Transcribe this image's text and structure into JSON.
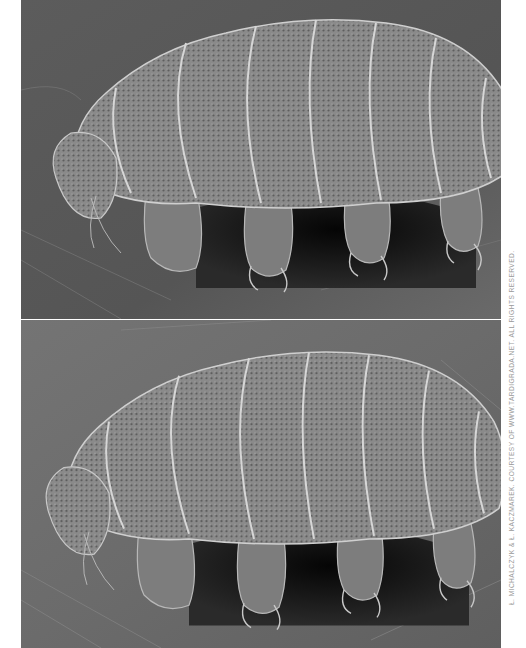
{
  "figure": {
    "panels": [
      {
        "label": "tardigrade-sem-view-1",
        "alt": "Scanning electron micrograph of a tardigrade (water bear) standing on a substrate, view 1"
      },
      {
        "label": "tardigrade-sem-view-2",
        "alt": "Scanning electron micrograph of the same tardigrade, slightly different angle, view 2"
      }
    ],
    "credit": "Ł. MICHALCZYK & Ł. KACZMAREK. COURTESY OF WWW.TARDIGRADA.NET. ALL RIGHTS RESERVED.",
    "colors": {
      "background": "#ffffff",
      "substrate": "#5a5a5a",
      "body": "#8c8c8c",
      "shadow": "#111111",
      "credit_text": "#9a9a9a"
    }
  }
}
